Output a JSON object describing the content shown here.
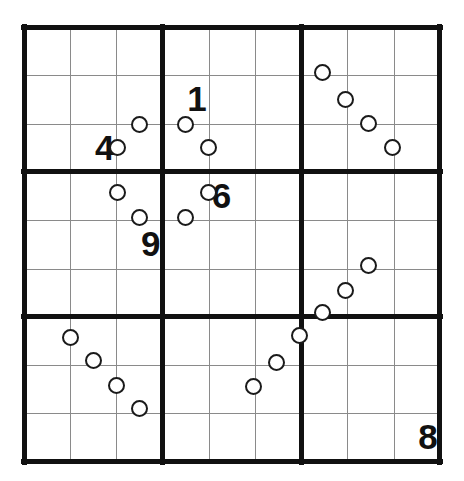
{
  "puzzle": {
    "title": "Sudoku",
    "type": "sudoku-variant",
    "grid_size": 9,
    "box_size": 3,
    "colors": {
      "background": "#ffffff",
      "thick_line": "#111111",
      "thin_line": "#8a8a8a",
      "digit": "#111111",
      "circle_stroke": "#1a1a1a",
      "circle_fill": "#ffffff"
    },
    "geometry": {
      "grid_left": 24,
      "grid_top": 27,
      "grid_width": 416,
      "grid_height": 435,
      "cell_width": 46.2,
      "cell_height": 48.3,
      "circle_diameter": 17
    },
    "givens": [
      {
        "id": "given-1",
        "value": "1",
        "row": 2,
        "col": 4,
        "align": "right"
      },
      {
        "id": "given-4",
        "value": "4",
        "row": 3,
        "col": 2,
        "align": "right"
      },
      {
        "id": "given-6",
        "value": "6",
        "row": 4,
        "col": 5,
        "align": "left"
      },
      {
        "id": "given-9",
        "value": "9",
        "row": 5,
        "col": 3,
        "align": "right"
      },
      {
        "id": "given-8",
        "value": "8",
        "row": 9,
        "col": 9,
        "align": "right"
      }
    ],
    "circles": [
      {
        "id": "circle-01",
        "x": 139,
        "y": 124,
        "edge": "r2c3-r3c3",
        "orientation": "horizontal"
      },
      {
        "id": "circle-02",
        "x": 117,
        "y": 147,
        "edge": "r3c2-r3c3",
        "orientation": "vertical"
      },
      {
        "id": "circle-03",
        "x": 185,
        "y": 124,
        "edge": "r2c4-r3c4",
        "orientation": "horizontal"
      },
      {
        "id": "circle-04",
        "x": 208,
        "y": 147,
        "edge": "r3c4-r3c5",
        "orientation": "vertical"
      },
      {
        "id": "circle-05",
        "x": 322,
        "y": 72,
        "edge": "r1c7-r2c7",
        "orientation": "horizontal"
      },
      {
        "id": "circle-06",
        "x": 345,
        "y": 99,
        "edge": "r2c7-r2c8",
        "orientation": "vertical"
      },
      {
        "id": "circle-07",
        "x": 368,
        "y": 123,
        "edge": "r2c8-r3c8",
        "orientation": "horizontal"
      },
      {
        "id": "circle-08",
        "x": 392,
        "y": 147,
        "edge": "r3c8-r3c9",
        "orientation": "vertical"
      },
      {
        "id": "circle-09",
        "x": 117,
        "y": 192,
        "edge": "r4c2-r4c3",
        "orientation": "vertical"
      },
      {
        "id": "circle-10",
        "x": 139,
        "y": 217,
        "edge": "r4c3-r5c3",
        "orientation": "horizontal"
      },
      {
        "id": "circle-11",
        "x": 208,
        "y": 192,
        "edge": "r4c4-r4c5",
        "orientation": "vertical"
      },
      {
        "id": "circle-12",
        "x": 185,
        "y": 217,
        "edge": "r4c4-r5c4",
        "orientation": "horizontal"
      },
      {
        "id": "circle-13",
        "x": 368,
        "y": 265,
        "edge": "r5c8-r6c8",
        "orientation": "horizontal"
      },
      {
        "id": "circle-14",
        "x": 345,
        "y": 290,
        "edge": "r6c7-r6c8",
        "orientation": "vertical"
      },
      {
        "id": "circle-15",
        "x": 322,
        "y": 312,
        "edge": "r6c7-r7c7",
        "orientation": "horizontal"
      },
      {
        "id": "circle-16",
        "x": 299,
        "y": 335,
        "edge": "r7c6-r7c7",
        "orientation": "vertical"
      },
      {
        "id": "circle-17",
        "x": 276,
        "y": 362,
        "edge": "r7c6-r8c6",
        "orientation": "horizontal"
      },
      {
        "id": "circle-18",
        "x": 253,
        "y": 386,
        "edge": "r8c5-r8c6",
        "orientation": "vertical"
      },
      {
        "id": "circle-19",
        "x": 70,
        "y": 337,
        "edge": "r7c1-r7c2",
        "orientation": "vertical"
      },
      {
        "id": "circle-20",
        "x": 93,
        "y": 360,
        "edge": "r7c2-r8c2",
        "orientation": "horizontal"
      },
      {
        "id": "circle-21",
        "x": 116,
        "y": 385,
        "edge": "r8c2-r8c3",
        "orientation": "vertical"
      },
      {
        "id": "circle-22",
        "x": 139,
        "y": 408,
        "edge": "r8c3-r9c3",
        "orientation": "horizontal"
      }
    ],
    "lines": {
      "thin_horizontal_rows": [
        1,
        2,
        4,
        5,
        7,
        8
      ],
      "thin_vertical_cols": [
        1,
        2,
        4,
        5,
        7,
        8
      ],
      "thick_horizontal_rows": [
        0,
        3,
        6,
        9
      ],
      "thick_vertical_cols": [
        0,
        3,
        6,
        9
      ]
    }
  }
}
